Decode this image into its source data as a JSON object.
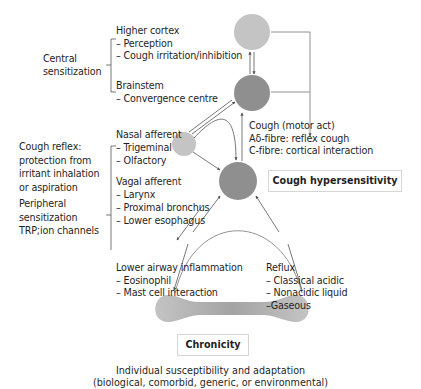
{
  "left_labels": {
    "central_sensitization": [
      "Central",
      "sensitization"
    ],
    "cough_reflex": [
      "Cough reflex:",
      "protection from",
      "irritant inhalation",
      "or aspiration"
    ],
    "peripheral_sensitization": [
      "Peripheral",
      "sensitization",
      "TRP;ion channels"
    ]
  },
  "higher_cortex": {
    "title": "Higher cortex",
    "items": [
      "– Perception",
      "– Cough irritation/inhibition"
    ]
  },
  "brainstem": {
    "title": "Brainstem",
    "items": [
      "– Convergence centre"
    ]
  },
  "nasal_afferent": {
    "title": "Nasal afferent",
    "items": [
      "– Trigeminal",
      "– Olfactory"
    ]
  },
  "vagal_afferent": {
    "title": "Vagal afferent",
    "items": [
      "– Larynx",
      "– Proximal bronchus",
      "– Lower esophagus"
    ]
  },
  "cough_output": {
    "lines": [
      "Cough (motor act)",
      "Aδ-fibre: reflex cough",
      "C-fibre: cortical interaction"
    ]
  },
  "lower_airway": {
    "title": "Lower airway inflammation",
    "items": [
      "– Eosinophil",
      "– Mast cell interaction"
    ]
  },
  "reflux": {
    "title": "Reflux",
    "items": [
      "– Classical acidic",
      "– Nonacidic liquid",
      "–Gaseous"
    ]
  },
  "boxes": {
    "cough_hypersensitivity": "Cough hypersensitivity",
    "chronicity": "Chronicity"
  },
  "footer": {
    "line1": "Individual susceptibility and adaptation",
    "line2": "(biological, comorbid, generic, or environmental)"
  },
  "colors": {
    "light_node": "#c4c4c4",
    "dark_node": "#8f8f8f",
    "mid_node": "#a3a3a3",
    "line": "#6a6a6a",
    "bracket": "#555555"
  }
}
